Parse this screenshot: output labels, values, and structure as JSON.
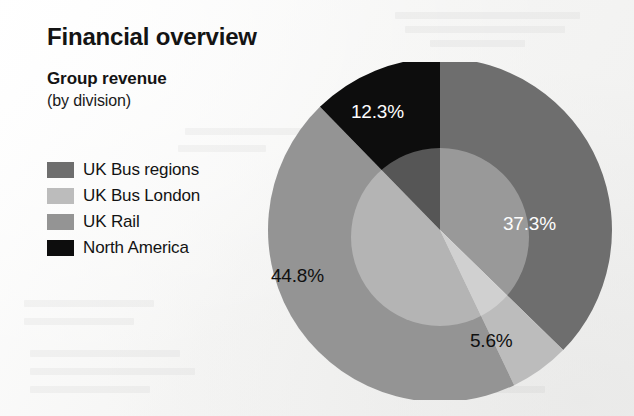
{
  "page": {
    "title": "Financial overview",
    "subtitle": "Group revenue",
    "subtitle_note": "(by division)",
    "background_color": "#f5f5f4"
  },
  "legend": {
    "items": [
      {
        "label": "UK Bus regions",
        "color": "#6e6e6e",
        "swatch_name": "legend-swatch-uk-bus-regions"
      },
      {
        "label": "UK Bus London",
        "color": "#bcbcbc",
        "swatch_name": "legend-swatch-uk-bus-london"
      },
      {
        "label": "UK Rail",
        "color": "#949494",
        "swatch_name": "legend-swatch-uk-rail"
      },
      {
        "label": "North America",
        "color": "#0d0d0d",
        "swatch_name": "legend-swatch-north-america"
      }
    ]
  },
  "labels": {
    "uk_bus_regions": "37.3%",
    "uk_bus_london": "5.6%",
    "uk_rail": "44.8%",
    "north_america": "12.3%"
  },
  "chart_data": {
    "type": "pie",
    "title": "Group revenue",
    "subtitle": "(by division)",
    "categories": [
      "UK Bus regions",
      "UK Bus London",
      "UK Rail",
      "North America"
    ],
    "values": [
      37.3,
      5.6,
      44.8,
      12.3
    ],
    "value_labels": [
      "37.3%",
      "5.6%",
      "44.8%",
      "12.3%"
    ],
    "unit": "percent",
    "total": 100.0,
    "colors": [
      "#6e6e6e",
      "#bcbcbc",
      "#949494",
      "#0d0d0d"
    ],
    "label_colors": [
      "#fdfdfd",
      "#101010",
      "#101010",
      "#fdfdfd"
    ],
    "start_angle_deg": 0,
    "direction": "clockwise",
    "legend": "left",
    "grid": false,
    "xlabel": "",
    "ylabel": "",
    "annotations": [
      "Inner translucent highlight circle overlays the pie centre"
    ]
  }
}
